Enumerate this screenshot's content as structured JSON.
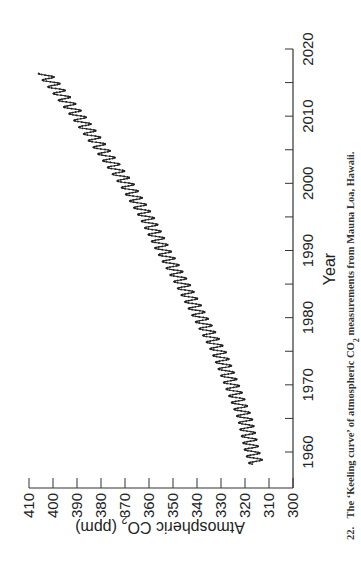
{
  "chart_data": {
    "type": "line",
    "title": "",
    "xlabel": "Year",
    "ylabel": "Atmospheric CO2 (ppm)",
    "xlim": [
      1955,
      2020
    ],
    "ylim": [
      300,
      410
    ],
    "x_ticks": [
      1960,
      1970,
      1980,
      1990,
      2000,
      2010,
      2020
    ],
    "x_minor_ticks": [
      1965,
      1975,
      1985,
      1995,
      2005,
      2015
    ],
    "y_ticks": [
      300,
      310,
      320,
      330,
      340,
      350,
      360,
      370,
      380,
      390,
      400,
      410
    ],
    "grid": false,
    "legend": null,
    "orientation": "rotated 90 degrees counter-clockwise on page",
    "series": [
      {
        "name": "Mauna Loa monthly CO2",
        "seasonal_amplitude_ppm": 6,
        "x": [
          1958,
          1960,
          1965,
          1970,
          1975,
          1980,
          1985,
          1990,
          1995,
          2000,
          2005,
          2010,
          2015,
          2016
        ],
        "values": [
          315,
          317,
          320,
          325.5,
          331,
          338.5,
          346,
          354,
          361,
          369.5,
          379.5,
          389.5,
          400.5,
          403
        ]
      }
    ]
  },
  "axes": {
    "x_label": "Year",
    "y_label_main": "Atmospheric CO",
    "y_label_sub": "2",
    "y_label_unit": " (ppm)"
  },
  "caption": {
    "number": "22.",
    "text_before": "The ‘Keeling curve’ of atmospheric CO",
    "subscript": "2",
    "text_after": " measurements from Mauna Loa, Hawaii."
  }
}
